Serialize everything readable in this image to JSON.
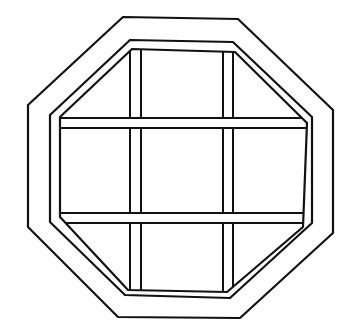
{
  "diagram": {
    "stroke_color": "#111111",
    "background": "#ffffff",
    "outer_frame": [
      [
        123,
        17
      ],
      [
        238,
        19
      ],
      [
        333,
        110
      ],
      [
        333,
        233
      ],
      [
        240,
        318
      ],
      [
        118,
        317
      ],
      [
        28,
        227
      ],
      [
        28,
        105
      ]
    ],
    "inner_frame": [
      [
        130,
        40
      ],
      [
        233,
        42
      ],
      [
        312,
        117
      ],
      [
        312,
        223
      ],
      [
        230,
        298
      ],
      [
        125,
        295
      ],
      [
        50,
        222
      ],
      [
        50,
        115
      ]
    ],
    "glass_edge": [
      [
        132,
        49
      ],
      [
        235,
        52
      ],
      [
        307,
        123
      ],
      [
        303,
        227
      ],
      [
        227,
        292
      ],
      [
        128,
        290
      ],
      [
        60,
        217
      ],
      [
        60,
        117
      ]
    ],
    "muntins": {
      "vertical": [
        {
          "x1": 130,
          "x2": 141
        },
        {
          "x1": 223,
          "x2": 233
        }
      ],
      "horizontal": [
        {
          "y1": 118,
          "y2": 128
        },
        {
          "y1": 213,
          "y2": 223
        }
      ]
    }
  }
}
